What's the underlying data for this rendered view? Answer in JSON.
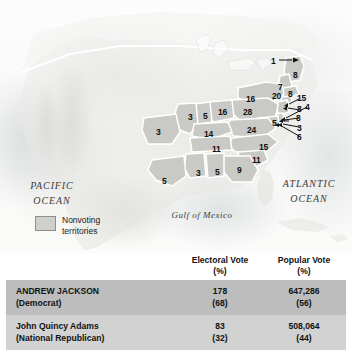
{
  "map": {
    "ocean_labels": {
      "pacific_line1": "PACIFIC",
      "pacific_line2": "OCEAN",
      "atlantic_line1": "ATLANTIC",
      "atlantic_line2": "OCEAN",
      "gulf": "Gulf of Mexico"
    },
    "legend": {
      "label_line1": "Nonvoting",
      "label_line2": "territories",
      "swatch_color": "#cfd0cd"
    },
    "state_electoral_votes": [
      {
        "label": "1",
        "x": 271,
        "y": 57,
        "note": "arrow-callout"
      },
      {
        "label": "8",
        "x": 293,
        "y": 71
      },
      {
        "label": "7",
        "x": 278,
        "y": 83
      },
      {
        "label": "8",
        "x": 288,
        "y": 90
      },
      {
        "label": "20",
        "x": 272,
        "y": 92
      },
      {
        "label": "16",
        "x": 246,
        "y": 95
      },
      {
        "label": "15",
        "x": 297,
        "y": 94,
        "note": "arrow-callout"
      },
      {
        "label": "4",
        "x": 305,
        "y": 103,
        "note": "arrow-callout"
      },
      {
        "label": "8",
        "x": 297,
        "y": 105,
        "note": "arrow-callout"
      },
      {
        "label": "8",
        "x": 296,
        "y": 114,
        "note": "arrow-callout"
      },
      {
        "label": "28",
        "x": 243,
        "y": 108
      },
      {
        "label": "3",
        "x": 297,
        "y": 124,
        "note": "arrow-callout"
      },
      {
        "label": "5",
        "x": 272,
        "y": 119,
        "note": "arrow-callout"
      },
      {
        "label": "6",
        "x": 297,
        "y": 133,
        "note": "arrow-callout"
      },
      {
        "label": "16",
        "x": 218,
        "y": 108
      },
      {
        "label": "5",
        "x": 203,
        "y": 112
      },
      {
        "label": "3",
        "x": 188,
        "y": 113
      },
      {
        "label": "3",
        "x": 156,
        "y": 128
      },
      {
        "label": "24",
        "x": 247,
        "y": 126
      },
      {
        "label": "14",
        "x": 204,
        "y": 130
      },
      {
        "label": "11",
        "x": 212,
        "y": 145
      },
      {
        "label": "15",
        "x": 259,
        "y": 143
      },
      {
        "label": "11",
        "x": 252,
        "y": 156
      },
      {
        "label": "9",
        "x": 237,
        "y": 166
      },
      {
        "label": "5",
        "x": 215,
        "y": 168
      },
      {
        "label": "3",
        "x": 196,
        "y": 169
      },
      {
        "label": "5",
        "x": 162,
        "y": 177
      }
    ]
  },
  "table": {
    "headers": [
      {
        "line1": "Electoral Vote",
        "line2": "(%)"
      },
      {
        "line1": "Popular Vote",
        "line2": "(%)"
      }
    ],
    "rows": [
      {
        "name": "ANDREW JACKSON",
        "party": "(Democrat)",
        "electoral": "178",
        "electoral_pct": "(68)",
        "popular": "647,286",
        "popular_pct": "(56)",
        "row_color": "#bdbdbd"
      },
      {
        "name": "John Quincy Adams",
        "party": "(National Republican)",
        "electoral": "83",
        "electoral_pct": "(32)",
        "popular": "508,064",
        "popular_pct": "(44)",
        "row_color": "#d2d2d2"
      }
    ]
  }
}
